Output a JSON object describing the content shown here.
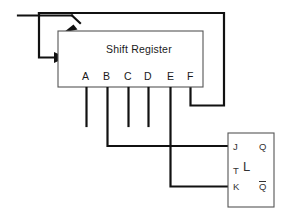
{
  "diagram": {
    "canvas": {
      "width": 281,
      "height": 216,
      "background": "#ffffff"
    },
    "line_color": "#111111",
    "box_stroke_color": "#555555"
  },
  "shift_register": {
    "label": "Shift Register",
    "box": {
      "x": 58,
      "y": 31,
      "width": 145,
      "height": 56
    },
    "output_pins": [
      {
        "name": "A",
        "x": 86,
        "label": "A"
      },
      {
        "name": "B",
        "x": 107,
        "label": "B"
      },
      {
        "name": "C",
        "x": 128,
        "label": "C"
      },
      {
        "name": "D",
        "x": 148,
        "label": "D"
      },
      {
        "name": "E",
        "x": 170,
        "label": "E"
      },
      {
        "name": "F",
        "x": 190,
        "label": "F"
      }
    ],
    "inputs": [
      {
        "name": "serial-data-input",
        "description": "diagonal arrow into top-left corner"
      },
      {
        "name": "clock-input",
        "description": "horizontal arrow into left edge"
      }
    ]
  },
  "flip_flop": {
    "name": "jk-flip-flop",
    "box": {
      "x": 228,
      "y": 133,
      "width": 46,
      "height": 74
    },
    "terminals": {
      "j": "J",
      "t": "T",
      "k": "K",
      "q": "Q",
      "q_not": "Q",
      "body": "L"
    }
  },
  "connections": [
    {
      "from": "B",
      "to": "J",
      "name": "wire-b-to-j"
    },
    {
      "from": "E",
      "to": "K",
      "name": "wire-e-to-k"
    },
    {
      "from": "F",
      "to": "serial-data-input",
      "name": "wire-f-feedback"
    }
  ]
}
